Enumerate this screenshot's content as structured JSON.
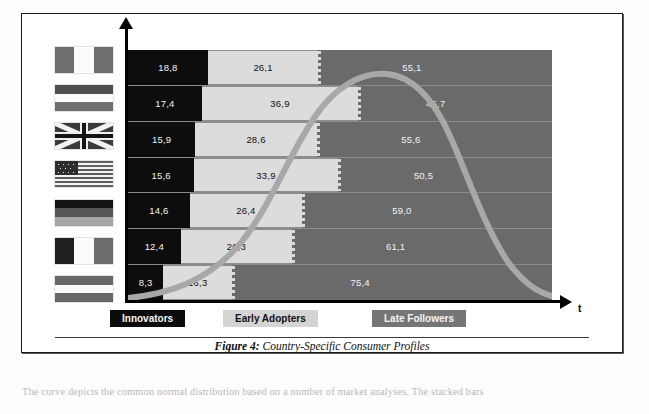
{
  "figure": {
    "caption_label": "Figure 4:",
    "caption_text": " Country-Specific Consumer Profiles",
    "axis_x_label": "t"
  },
  "legend": {
    "innovators": "Innovators",
    "early_adopters": "Early Adopters",
    "late_followers": "Late Followers"
  },
  "colors": {
    "innovators": "#0d0d0d",
    "early_adopters": "#dcdcdc",
    "late_followers": "#6a6a6a",
    "curve": "#a8a8a8",
    "frame": "#1a1a1a"
  },
  "flags": [
    {
      "name": "canada",
      "class": "flag-ca",
      "orientation": "vertical"
    },
    {
      "name": "netherlands",
      "class": "flag-nl",
      "orientation": "horizontal"
    },
    {
      "name": "united-kingdom",
      "class": "flag-uk",
      "orientation": "union-jack"
    },
    {
      "name": "united-states",
      "class": "flag-us",
      "orientation": "stars-and-stripes"
    },
    {
      "name": "germany",
      "class": "flag-de",
      "orientation": "horizontal"
    },
    {
      "name": "france",
      "class": "flag-fr",
      "orientation": "vertical"
    },
    {
      "name": "austria",
      "class": "flag-at",
      "orientation": "horizontal"
    }
  ],
  "body_text": "The curve depicts the common normal distribution based on a number of market analyses. The stacked bars",
  "chart_data": {
    "type": "bar",
    "subtype": "stacked-horizontal-100-percent",
    "title": "Country-Specific Consumer Profiles",
    "xlabel": "t",
    "ylabel": "",
    "xlim": [
      0,
      100
    ],
    "grid": false,
    "legend_position": "bottom",
    "categories": [
      "Canada",
      "Netherlands",
      "United Kingdom",
      "United States",
      "Germany",
      "France",
      "Austria"
    ],
    "series": [
      {
        "name": "Innovators",
        "color": "#0d0d0d",
        "values": [
          18.8,
          17.4,
          15.9,
          15.6,
          14.6,
          12.4,
          8.3
        ],
        "labels": [
          "18,8",
          "17,4",
          "15,9",
          "15,6",
          "14,6",
          "12,4",
          "8,3"
        ]
      },
      {
        "name": "Early Adopters",
        "color": "#dcdcdc",
        "values": [
          26.1,
          36.9,
          28.6,
          33.9,
          26.4,
          26.3,
          16.3
        ],
        "labels": [
          "26,1",
          "36,9",
          "28,6",
          "33,9",
          "26,4",
          "26,3",
          "16,3"
        ]
      },
      {
        "name": "Late Followers",
        "color": "#6a6a6a",
        "values": [
          55.1,
          45.7,
          55.6,
          50.5,
          59.0,
          61.1,
          75.4
        ],
        "labels": [
          "55,1",
          "45,7",
          "55,6",
          "50,5",
          "59,0",
          "61,1",
          "75,4"
        ]
      }
    ],
    "overlay_curve": {
      "name": "Diffusion bell curve",
      "type": "line",
      "color": "#a8a8a8",
      "description": "Normal-distribution adoption curve rising from lower-left, peaking near the Innovators/Early-Adopters boundary, then falling to the lower-right"
    }
  }
}
